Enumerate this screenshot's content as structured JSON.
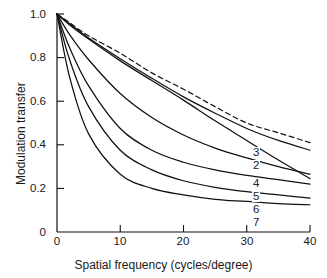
{
  "chart_data": {
    "type": "line",
    "title": "",
    "xlabel": "Spatial frequency (cycles/degree)",
    "ylabel": "Modulation transfer",
    "xlim": [
      0,
      40
    ],
    "ylim": [
      0,
      1.0
    ],
    "xticks": [
      "0",
      "10",
      "20",
      "30",
      "40"
    ],
    "xtick_values": [
      0,
      10,
      20,
      30,
      40
    ],
    "yticks": [
      "0",
      "0.2",
      "0.4",
      "0.6",
      "0.8",
      "1.0"
    ],
    "ytick_values": [
      0,
      0.2,
      0.4,
      0.6,
      0.8,
      1.0
    ],
    "grid": false,
    "legend": "inline-curve-labels",
    "x": [
      0,
      2,
      5,
      10,
      15,
      20,
      25,
      30,
      35,
      40
    ],
    "series": [
      {
        "name": "dashed-reference",
        "label": "",
        "style": "dashed",
        "values": [
          1.0,
          0.96,
          0.9,
          0.82,
          0.73,
          0.655,
          0.575,
          0.5,
          0.455,
          0.41
        ]
      },
      {
        "name": "curve-3",
        "label": "3",
        "style": "solid",
        "values": [
          1.0,
          0.955,
          0.89,
          0.795,
          0.705,
          0.62,
          0.545,
          0.475,
          0.42,
          0.375
        ]
      },
      {
        "name": "curve-2",
        "label": "2",
        "style": "solid",
        "values": [
          1.0,
          0.95,
          0.885,
          0.785,
          0.695,
          0.605,
          0.51,
          0.42,
          0.33,
          0.245
        ]
      },
      {
        "name": "curve-4",
        "label": "4",
        "style": "solid",
        "values": [
          1.0,
          0.905,
          0.79,
          0.635,
          0.525,
          0.445,
          0.385,
          0.34,
          0.3,
          0.265
        ]
      },
      {
        "name": "curve-5",
        "label": "5",
        "style": "solid",
        "values": [
          1.0,
          0.845,
          0.67,
          0.475,
          0.375,
          0.32,
          0.285,
          0.26,
          0.24,
          0.22
        ]
      },
      {
        "name": "curve-6",
        "label": "6",
        "style": "solid",
        "values": [
          1.0,
          0.79,
          0.575,
          0.375,
          0.285,
          0.235,
          0.205,
          0.185,
          0.17,
          0.155
        ]
      },
      {
        "name": "curve-7",
        "label": "7",
        "style": "solid",
        "values": [
          1.0,
          0.71,
          0.45,
          0.265,
          0.2,
          0.17,
          0.15,
          0.14,
          0.13,
          0.125
        ]
      }
    ],
    "curve_labels": [
      {
        "text": "3",
        "x_px": 252,
        "y_px": 147
      },
      {
        "text": "2",
        "x_px": 252,
        "y_px": 160
      },
      {
        "text": "4",
        "x_px": 252,
        "y_px": 178
      },
      {
        "text": "5",
        "x_px": 252,
        "y_px": 191
      },
      {
        "text": "6",
        "x_px": 252,
        "y_px": 204
      },
      {
        "text": "7",
        "x_px": 252,
        "y_px": 217
      }
    ],
    "colors": {
      "line": "#111111",
      "axis": "#111111",
      "background": "#ffffff"
    }
  }
}
